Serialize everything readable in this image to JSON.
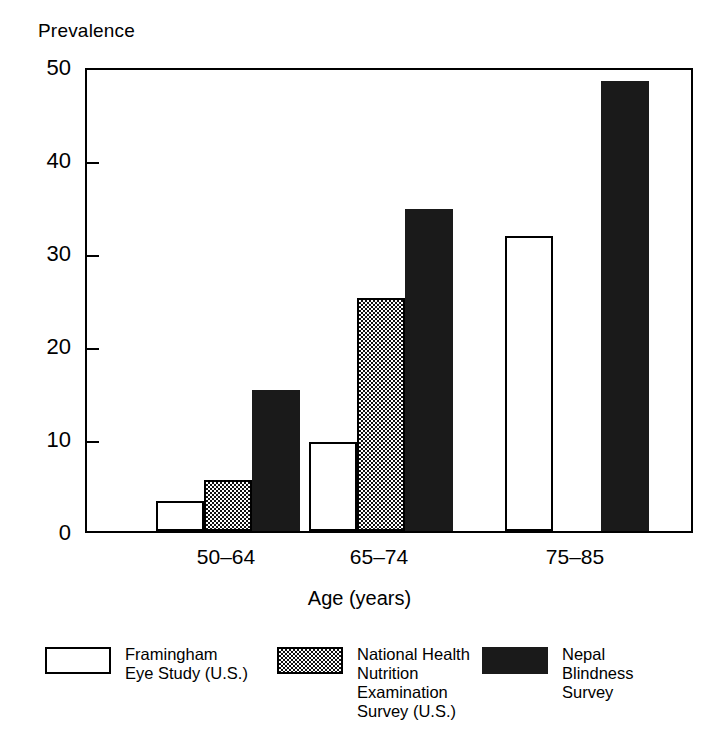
{
  "chart_data": {
    "type": "bar",
    "title": "",
    "ylabel": "Prevalence",
    "xlabel": "Age (years)",
    "categories": [
      "50–64",
      "65–74",
      "75–85"
    ],
    "ylim": [
      0,
      50
    ],
    "yticks": [
      0,
      10,
      20,
      30,
      40,
      50
    ],
    "ytick_labels": [
      "0",
      "10",
      "20",
      "30",
      "40",
      "50"
    ],
    "grid": false,
    "legend_position": "bottom",
    "series": [
      {
        "name": "Framingham\nEye Study (U.S.)",
        "pattern": "open",
        "values": [
          3.2,
          9.6,
          31.7
        ]
      },
      {
        "name": "National Health\nNutrition\nExamination\nSurvey (U.S.)",
        "pattern": "checker",
        "values": [
          5.5,
          25.1,
          null
        ]
      },
      {
        "name": "Nepal\nBlindness\nSurvey",
        "pattern": "solid",
        "values": [
          15.2,
          34.6,
          48.4
        ]
      }
    ]
  },
  "colors": {
    "ink": "#000000",
    "solid_fill": "#1a1a1a",
    "open_fill": "#ffffff",
    "background": "#ffffff"
  }
}
